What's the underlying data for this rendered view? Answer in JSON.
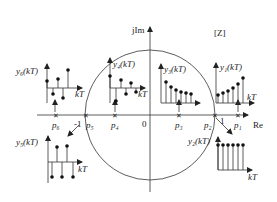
{
  "diagram": {
    "plane_label": "[Z]",
    "axes": {
      "imag_label": "jIm",
      "real_label": "Re",
      "origin_label": "0",
      "minus_one_label": "-1",
      "one_label": "1"
    },
    "poles": [
      {
        "name": "p1",
        "label": "p₁"
      },
      {
        "name": "p2",
        "label": "p₂"
      },
      {
        "name": "p3",
        "label": "p₃"
      },
      {
        "name": "p4",
        "label": "p₄"
      },
      {
        "name": "p5",
        "label": "p₅"
      },
      {
        "name": "p6",
        "label": "p₆"
      }
    ],
    "responses": [
      {
        "name": "y1",
        "label": "y₁(kT)",
        "axis_label": "kT",
        "description": "growing monotonic"
      },
      {
        "name": "y2",
        "label": "y₂(kT)",
        "axis_label": "kT",
        "description": "constant"
      },
      {
        "name": "y3",
        "label": "y₃(kT)",
        "axis_label": "kT",
        "description": "decaying monotonic"
      },
      {
        "name": "y4",
        "label": "y₄(kT)",
        "axis_label": "kT",
        "description": "decaying alternating"
      },
      {
        "name": "y5",
        "label": "y₅(kT)",
        "axis_label": "kT",
        "description": "constant alternating"
      },
      {
        "name": "y6",
        "label": "y₆(kT)",
        "axis_label": "kT",
        "description": "growing alternating"
      }
    ]
  }
}
